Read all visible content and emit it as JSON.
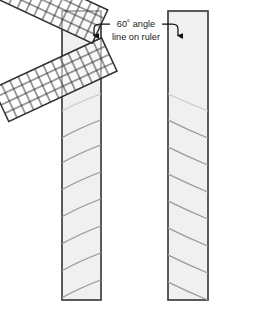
{
  "figure": {
    "background_color": "#ffffff",
    "width": 271,
    "height": 311
  },
  "annotation": {
    "line1": "60˚ angle",
    "line2": "line on ruler",
    "text_color": "#1a1a1a",
    "leader_left": "leader-line-left",
    "leader_right": "leader-line-right",
    "arrow_left": "arrowhead-left",
    "arrow_right": "arrowhead-right"
  },
  "boards": [
    {
      "id": "left-board",
      "label": "left board",
      "x": 62,
      "y": 11,
      "width": 39,
      "height": 289,
      "fill": "#f0f0f0",
      "stroke": "#3f3f3f",
      "grain_direction": "up-right",
      "grain_count": 8,
      "grain_color": "#9a9a9a"
    },
    {
      "id": "right-board",
      "label": "right board",
      "x": 168,
      "y": 11,
      "width": 40,
      "height": 289,
      "fill": "#f0f0f0",
      "stroke": "#3f3f3f",
      "grain_direction": "down-right",
      "grain_count": 8,
      "grain_color": "#9a9a9a"
    }
  ],
  "rulers": [
    {
      "id": "left-ruler",
      "label": "gridded ruler on left board",
      "rotation_deg": -25,
      "columns": 13,
      "rows": 4,
      "cell_size": 9.2,
      "fill": "#ffffff",
      "fill_opacity": 0.55,
      "grid_color": "#2e2e2e",
      "pivot_x": 101,
      "pivot_y": 38
    },
    {
      "id": "right-ruler",
      "label": "gridded ruler on right board",
      "rotation_deg": 25,
      "columns": 13,
      "rows": 4,
      "cell_size": 9.2,
      "fill": "#ffffff",
      "fill_opacity": 0.55,
      "grid_color": "#2e2e2e",
      "pivot_x": 168,
      "pivot_y": 38
    }
  ],
  "colors": {
    "board_fill": "#f0f0f0",
    "board_stroke": "#3f3f3f",
    "grain": "#9a9a9a",
    "ruler_grid": "#2e2e2e",
    "text": "#1a1a1a"
  }
}
